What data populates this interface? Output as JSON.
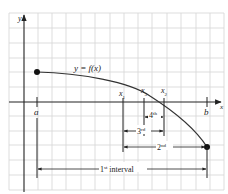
{
  "diagram": {
    "function_label": "y = f(x)",
    "axes": {
      "x_label": "x",
      "y_label": "y"
    },
    "points": {
      "a": "a",
      "b": "b",
      "x1": "x",
      "x1_sub": "1",
      "x2": "x",
      "x2_sub": "2",
      "x3": "x",
      "x3_sub": "3"
    },
    "intervals": [
      {
        "num": "1",
        "sup": "st",
        "suffix": " interval"
      },
      {
        "num": "2",
        "sup": "nd"
      },
      {
        "num": "3",
        "sup": "rd"
      },
      {
        "num": "4",
        "sup": "th"
      }
    ],
    "colors": {
      "grid": "#d4d4d4",
      "axis": "#222222",
      "curve": "#333333",
      "text": "#222222"
    }
  }
}
